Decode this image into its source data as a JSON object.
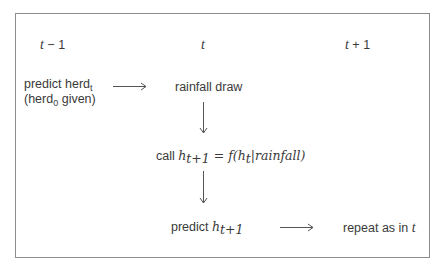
{
  "diagram": {
    "columns": [
      {
        "label_var": "t",
        "label_op": " − 1"
      },
      {
        "label_var": "t",
        "label_op": ""
      },
      {
        "label_var": "t",
        "label_op": " + 1"
      }
    ],
    "nodes": {
      "predict_herd": {
        "line1_text": "predict herd",
        "line1_sub": "t",
        "line2_open": "(herd",
        "line2_sub": "0",
        "line2_close": " given)"
      },
      "rainfall_draw": {
        "text": "rainfall draw"
      },
      "call_step": {
        "prefix": "call ",
        "h": "h",
        "h_sub": "t+1",
        "eq": " = f(",
        "h2": "h",
        "h2_sub": "t",
        "cond": "|rainfall)"
      },
      "predict_h": {
        "prefix": "predict ",
        "h": "h",
        "h_sub": "t+1"
      },
      "repeat": {
        "text": "repeat as in ",
        "var": "t"
      }
    },
    "edges": [
      {
        "from": "predict_herd",
        "to": "rainfall_draw",
        "direction": "right"
      },
      {
        "from": "rainfall_draw",
        "to": "call_step",
        "direction": "down"
      },
      {
        "from": "call_step",
        "to": "predict_h",
        "direction": "down"
      },
      {
        "from": "predict_h",
        "to": "repeat",
        "direction": "right"
      }
    ],
    "colors": {
      "border": "#8c8c8c",
      "arrow": "#555555",
      "text": "#3a3a3a"
    }
  }
}
